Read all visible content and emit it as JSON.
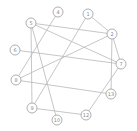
{
  "graph": {
    "nodes": [
      {
        "id": "4",
        "label": "4",
        "x": 58,
        "y": 12
      },
      {
        "id": "5",
        "label": "5",
        "x": 31,
        "y": 23
      },
      {
        "id": "1",
        "label": "1",
        "x": 88,
        "y": 14
      },
      {
        "id": "2",
        "label": "2",
        "x": 112,
        "y": 34
      },
      {
        "id": "6",
        "label": "6",
        "x": 15,
        "y": 50
      },
      {
        "id": "7",
        "label": "7",
        "x": 121,
        "y": 64
      },
      {
        "id": "8",
        "label": "8",
        "x": 16,
        "y": 80
      },
      {
        "id": "13",
        "label": "13",
        "x": 111,
        "y": 94
      },
      {
        "id": "9",
        "label": "9",
        "x": 32,
        "y": 108
      },
      {
        "id": "12",
        "label": "12",
        "x": 86,
        "y": 115
      },
      {
        "id": "10",
        "label": "10",
        "x": 57,
        "y": 120
      }
    ],
    "edges": [
      [
        "4",
        "8"
      ],
      [
        "5",
        "2"
      ],
      [
        "5",
        "7"
      ],
      [
        "5",
        "9"
      ],
      [
        "5",
        "10"
      ],
      [
        "1",
        "2"
      ],
      [
        "1",
        "9"
      ],
      [
        "2",
        "7"
      ],
      [
        "2",
        "8"
      ],
      [
        "2",
        "13"
      ],
      [
        "6",
        "7"
      ],
      [
        "8",
        "13"
      ],
      [
        "9",
        "12"
      ],
      [
        "7",
        "12"
      ]
    ],
    "node_radius": 5,
    "colors": {
      "edge": "#b8b8b8",
      "node_stroke": "#9a9a9a",
      "label": "#8a8a8a",
      "background": "#ffffff"
    }
  }
}
